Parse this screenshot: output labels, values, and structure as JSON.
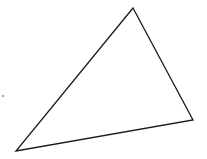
{
  "diagram": {
    "shape": "triangle",
    "vertices": [
      [
        133,
        8
      ],
      [
        193,
        120
      ],
      [
        16,
        151
      ]
    ],
    "stroke": "#1a1a1a",
    "stroke_width": 1.3,
    "fill": "none",
    "dot": [
      3,
      96
    ]
  }
}
